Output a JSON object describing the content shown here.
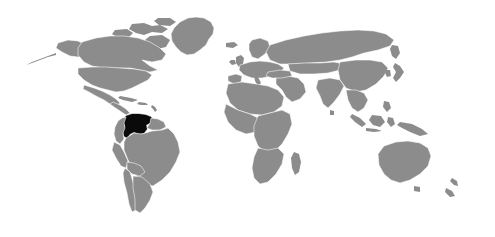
{
  "figure": {
    "type": "locator-map",
    "caption": "",
    "width": 495,
    "height": 237
  },
  "map": {
    "projection": "equirectangular",
    "background_color": "#ffffff",
    "land_color": "#8c8c8c",
    "border_color": "#ffffff",
    "highlight_color": "#0a0a0a",
    "antarctica_shown": "no",
    "labels_shown": "none",
    "graticule_shown": "none",
    "highlighted_country": "Venezuela",
    "highlighted_region": "northern South America",
    "continents": [
      "North America",
      "South America",
      "Europe",
      "Africa",
      "Asia",
      "Oceania"
    ],
    "notable_landmasses": [
      "Greenland",
      "Alaska",
      "Madagascar",
      "Australia",
      "New Zealand",
      "Japan",
      "Iceland",
      "United Kingdom",
      "Sri Lanka",
      "Cuba",
      "Borneo",
      "New Guinea"
    ]
  },
  "legend": {
    "items": [
      {
        "label": "Venezuela",
        "color": "#0a0a0a"
      },
      {
        "label": "Other countries",
        "color": "#8c8c8c"
      },
      {
        "label": "Water",
        "color": "#ffffff"
      }
    ]
  }
}
